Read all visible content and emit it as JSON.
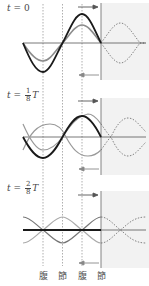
{
  "panels": [
    {
      "time_label": {
        "prefix": "t = ",
        "value": "0",
        "fraction": null,
        "suffix": ""
      }
    },
    {
      "time_label": {
        "prefix": "t = ",
        "value": null,
        "fraction": {
          "num": "1",
          "den": "8"
        },
        "suffix": "T"
      }
    },
    {
      "time_label": {
        "prefix": "t = ",
        "value": null,
        "fraction": {
          "num": "2",
          "den": "8"
        },
        "suffix": "T"
      }
    }
  ],
  "bottom_labels": [
    "腹",
    "節",
    "腹",
    "節"
  ],
  "legend_semantics": {
    "gray_curve_right_arrow": "incident wave",
    "gray_curve_left_arrow": "reflected wave",
    "black_curve": "resultant standing wave",
    "dotted_curves_in_shaded_region": "virtual continuation beyond reflecting wall"
  },
  "colors": {
    "resultant": "#1a1a1a",
    "component": "#8c8c8c",
    "axis": "#555555",
    "wall": "#777777",
    "shade": "#f2f2f2",
    "guide": "#999999"
  }
}
